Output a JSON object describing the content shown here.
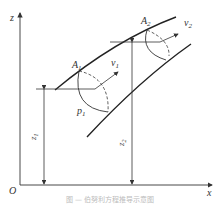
{
  "diagram": {
    "axes": {
      "origin_label": "O",
      "x_label": "x",
      "z_label": "z"
    },
    "section1": {
      "area_label": "A",
      "area_sub": "1",
      "velocity_label": "v",
      "velocity_sub": "1",
      "pressure_label": "p",
      "pressure_sub": "1",
      "height_label": "z",
      "height_sub": "1"
    },
    "section2": {
      "area_label": "A",
      "area_sub": "2",
      "velocity_label": "v",
      "velocity_sub": "2",
      "height_label": "z",
      "height_sub": "2"
    },
    "caption": "图 — 伯努利方程推导示意图"
  }
}
